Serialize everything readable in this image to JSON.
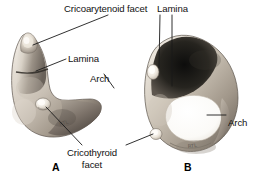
{
  "figure": {
    "background_color": "#ffffff",
    "label_color": "#111111",
    "leader_line_color": "#1a1a1a"
  },
  "labels": {
    "cricoarytenoid_facet": "Cricoarytenoid facet",
    "lamina_a": "Lamina",
    "arch_a": "Arch",
    "cricothyroid_facet": "Cricothyroid facet",
    "lamina_b": "Lamina",
    "arch_b": "Arch"
  },
  "panels": [
    {
      "letter": "A",
      "view": "lateral view",
      "labels": [
        "Cricoarytenoid facet",
        "Lamina",
        "Arch",
        "Cricothyroid facet"
      ]
    },
    {
      "letter": "B",
      "view": "superior oblique view",
      "labels": [
        "Cricoarytenoid facet",
        "Lamina",
        "Arch",
        "Cricothyroid facet"
      ]
    }
  ],
  "panel_letters": {
    "a": "A",
    "b": "B"
  },
  "specimen_scale_marks": {
    "panel_a": "RTL",
    "panel_b": "RTL"
  }
}
